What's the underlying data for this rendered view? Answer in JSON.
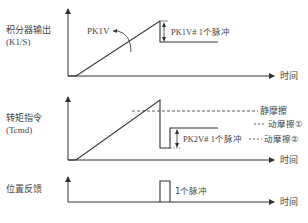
{
  "panels": [
    {
      "id": "integrator-output",
      "label_line1": "积分器输出",
      "label_line2": "(K1/S)",
      "x_axis_label": "时间",
      "annotations": {
        "pk1v": "PK1V",
        "pk1v_step": "PK1V# 1个脉冲"
      }
    },
    {
      "id": "torque-command",
      "label_line1": "转矩指令",
      "label_line2": "(Tcmd)",
      "x_axis_label": "时间",
      "annotations": {
        "static_friction": "静摩擦",
        "dynamic_friction_1": "动摩擦①",
        "pk2v_step": "PK2V#  1个脉冲",
        "dynamic_friction_2": "动摩擦②"
      }
    },
    {
      "id": "position-feedback",
      "label_line1": "位置反馈",
      "x_axis_label": "时间",
      "annotations": {
        "pulse": "1个脉冲"
      }
    }
  ],
  "colors": {
    "line": "#333333",
    "text": "#444444",
    "background": "#ffffff"
  }
}
